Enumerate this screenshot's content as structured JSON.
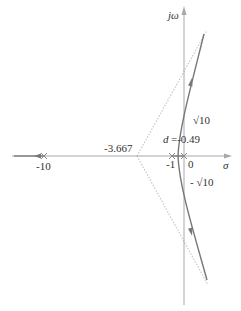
{
  "diagram": {
    "type": "root-locus",
    "axes": {
      "real_label": "σ",
      "imag_label": "jω",
      "color": "#9a9a9a"
    },
    "poles": [
      {
        "label": "-10",
        "value": -10
      },
      {
        "label": "-1",
        "value": -1
      },
      {
        "label": "0",
        "value": 0
      }
    ],
    "annotations": {
      "asymptote_center": "-3.667",
      "breakaway_d": "d",
      "breakaway_value": "=-0.49",
      "imag_cross_pos": "√10",
      "imag_cross_neg": "- √10"
    },
    "colors": {
      "locus": "#777777",
      "asymptote": "#c8c8c8",
      "axis": "#a8a8a8",
      "text": "#333333"
    }
  }
}
